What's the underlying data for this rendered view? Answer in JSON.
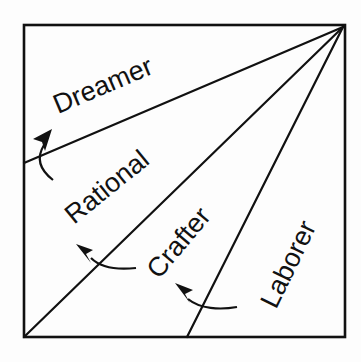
{
  "diagram": {
    "type": "temperament-wedge-diagram",
    "regions": [
      {
        "id": "dreamer",
        "label": "Dreamer"
      },
      {
        "id": "rational",
        "label": "Rational"
      },
      {
        "id": "crafter",
        "label": "Crafter"
      },
      {
        "id": "laborer",
        "label": "Laborer"
      }
    ],
    "arrows": [
      {
        "from": "rational",
        "to": "dreamer",
        "direction": "counterclockwise"
      },
      {
        "from": "crafter",
        "to": "rational",
        "direction": "counterclockwise"
      },
      {
        "from": "laborer",
        "to": "crafter",
        "direction": "counterclockwise"
      }
    ],
    "colors": {
      "ink": "#111111",
      "background": "#fdfdfd"
    }
  }
}
